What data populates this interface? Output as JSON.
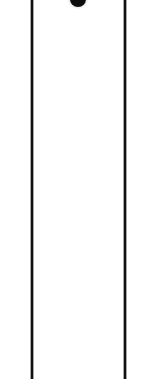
{
  "figure": {
    "kind": "scanned-column-fragment",
    "width_px": 153,
    "height_px": 379,
    "background_color": "#ffffff",
    "ink_color": "#111111"
  },
  "rules": {
    "left": {
      "label": "left vertical rule",
      "x_px": 31,
      "width_px": 2,
      "top_px": 0,
      "height_px": 379,
      "color": "#111111"
    },
    "right": {
      "label": "right vertical rule",
      "x_px": 124,
      "width_px": 2,
      "top_px": 0,
      "height_px": 379,
      "color": "#111111"
    }
  },
  "marks": {
    "top_blob": {
      "label": "clipped dark mark",
      "center_x_px": 78,
      "center_y_px": -1,
      "diameter_px": 16,
      "color": "#0d0d0d",
      "clipped_edge": "top"
    }
  },
  "interior": {
    "label": "blank column interior",
    "left_px": 33,
    "width_px": 91,
    "content": ""
  },
  "margins": {
    "left": {
      "label": "left margin",
      "width_px": 31,
      "content": ""
    },
    "right": {
      "label": "right margin",
      "width_px": 27,
      "content": ""
    }
  }
}
